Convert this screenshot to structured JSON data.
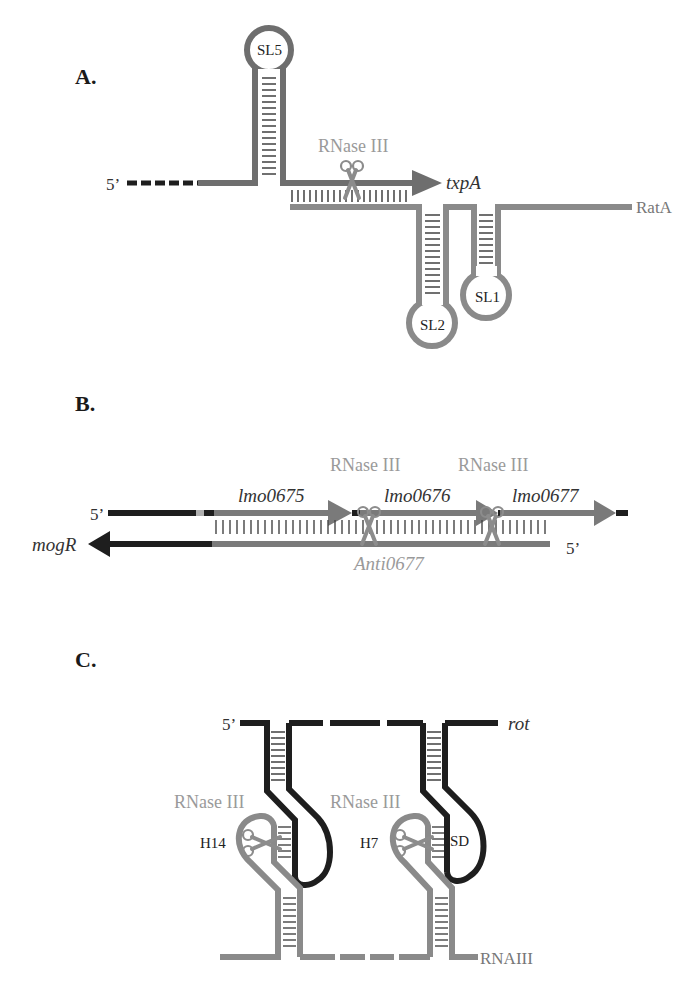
{
  "panels": [
    {
      "id": "A",
      "label": "A.",
      "five_prime": "5’",
      "enzyme": "RNase III",
      "gene": "txpA",
      "antisense_rna": "RatA",
      "stem_loops": [
        "SL5",
        "SL2",
        "SL1"
      ]
    },
    {
      "id": "B",
      "label": "B.",
      "five_prime_top": "5’",
      "five_prime_bottom": "5’",
      "enzymes": [
        "RNase III",
        "RNase III"
      ],
      "genes": [
        "lmo0675",
        "lmo0676",
        "lmo0677"
      ],
      "reverse_gene": "mogR",
      "antisense_rna": "Anti0677"
    },
    {
      "id": "C",
      "label": "C.",
      "five_prime": "5’",
      "target": "rot",
      "enzymes": [
        "RNase III",
        "RNase III"
      ],
      "hairpins": [
        "H14",
        "H7"
      ],
      "sd_label": "SD",
      "regulator": "RNAIII"
    }
  ],
  "colors": {
    "dark_strand": "#1e1e1e",
    "gray_strand": "#7a7a7a",
    "enzyme_label": "#9a9a9a",
    "scissors": "#8c8c8c"
  }
}
